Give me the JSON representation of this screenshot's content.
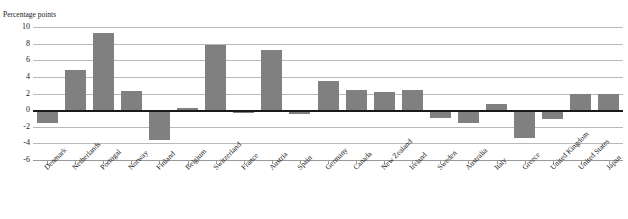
{
  "chart_data": {
    "type": "bar",
    "title": "",
    "subtitle": "",
    "xlabel": "",
    "ylabel": "Percentage points",
    "ylim": [
      -6,
      10
    ],
    "ytick_step": 2,
    "yticks": [
      10,
      8,
      6,
      4,
      2,
      0,
      -2,
      -4,
      -6
    ],
    "grid": true,
    "legend": false,
    "legend_position": "none",
    "bar_color": "#808080",
    "zero_line_color": "#1a1a1a",
    "categories": [
      "Denmark",
      "Netherlands",
      "Portugal",
      "Norway",
      "Finland",
      "Belgium",
      "Switzerland",
      "France",
      "Austria",
      "Spain",
      "Germany",
      "Canada",
      "New Zealand",
      "Ireland",
      "Sweden",
      "Australia",
      "Italy",
      "Greece",
      "United Kingdom",
      "United States",
      "Japan"
    ],
    "values": [
      -1.5,
      4.8,
      9.3,
      2.3,
      -3.6,
      0.2,
      7.8,
      -0.3,
      7.2,
      -0.5,
      3.5,
      2.4,
      2.2,
      2.4,
      -1.0,
      -1.6,
      0.7,
      -3.4,
      -1.1,
      2.0,
      2.0
    ]
  },
  "axis": {
    "y_title": "Percentage points"
  }
}
